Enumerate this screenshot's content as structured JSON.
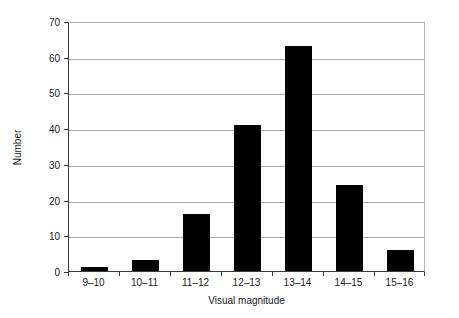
{
  "chart_data": {
    "type": "bar",
    "title": "",
    "xlabel": "Visual magnitude",
    "ylabel": "Number",
    "categories": [
      "9–10",
      "10–11",
      "11–12",
      "12–13",
      "13–14",
      "14–15",
      "15–16"
    ],
    "values": [
      1,
      3,
      16,
      41,
      63,
      24,
      6
    ],
    "ylim": [
      0,
      70
    ],
    "yticks": [
      0,
      10,
      20,
      30,
      40,
      50,
      60,
      70
    ],
    "ytick_labels": [
      "0",
      "10",
      "20",
      "30",
      "40",
      "50",
      "60",
      "70"
    ],
    "grid": true,
    "grid_axis": "y",
    "legend": null,
    "bar_color": "#000000",
    "gridline_color": "#a9a9a9",
    "axis_color": "#3a3a3a",
    "plot_border_color": "#b4b4b4",
    "background_color": "#ffffff"
  }
}
